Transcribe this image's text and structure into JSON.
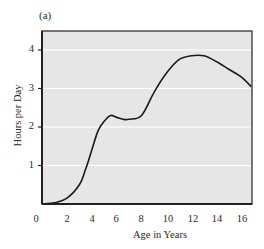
{
  "chart_data": {
    "type": "line",
    "panel_label": "(a)",
    "title": "",
    "xlabel": "Age in Years",
    "ylabel": "Hours per Day",
    "xlim": [
      0,
      17
    ],
    "ylim": [
      0,
      4.5
    ],
    "x_ticks": [
      0,
      2,
      4,
      6,
      8,
      10,
      12,
      14,
      16
    ],
    "x_tick_labels": [
      "0",
      "2",
      "4",
      "6",
      "8",
      "10",
      "12",
      "14",
      "16"
    ],
    "y_ticks": [
      1,
      2,
      3,
      4
    ],
    "y_tick_labels": [
      "1",
      "2",
      "3",
      "4"
    ],
    "grid": "horizontal white lines at y = 1, 2, 3, 4",
    "background_color": "#e6e6e6",
    "line_color": "#1a1a1a",
    "series": [
      {
        "name": "Hours per Day",
        "x": [
          0,
          1,
          2,
          3,
          3.5,
          4,
          4.5,
          5,
          5.5,
          6,
          6.5,
          7,
          8,
          9,
          10,
          11,
          12,
          13,
          14,
          15,
          16,
          16.8
        ],
        "y": [
          0,
          0.03,
          0.15,
          0.5,
          0.9,
          1.4,
          1.9,
          2.15,
          2.3,
          2.25,
          2.2,
          2.2,
          2.3,
          2.9,
          3.4,
          3.75,
          3.85,
          3.85,
          3.7,
          3.5,
          3.3,
          3.05
        ]
      }
    ]
  }
}
